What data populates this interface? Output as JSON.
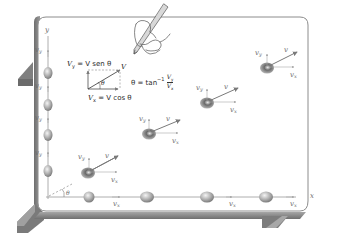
{
  "figure": {
    "colors": {
      "board_fill": "#ffffff",
      "board_frame": "#8a8a8a",
      "frame_dark": "#6e6e6e",
      "vector": "#7a7a7a",
      "ball": "#a8a8a8"
    }
  },
  "formulas": {
    "vy": "V",
    "vy_sub": "y",
    "vy_rest": " = V sen θ",
    "vx": "V",
    "vx_sub": "x",
    "vx_rest": " = V cos θ",
    "theta_lhs": "θ = tan",
    "theta_exp": "−1",
    "theta_num": "V",
    "theta_num_sub": "y",
    "theta_den": "V",
    "theta_den_sub": "x",
    "triangle_v": "V",
    "triangle_theta": "θ"
  },
  "axes": {
    "x_label": "x",
    "y_label": "y",
    "origin_theta": "θ"
  },
  "labels": {
    "v": "v",
    "vx": "v",
    "vx_sub": "x",
    "vy": "v",
    "vy_sub": "y"
  }
}
